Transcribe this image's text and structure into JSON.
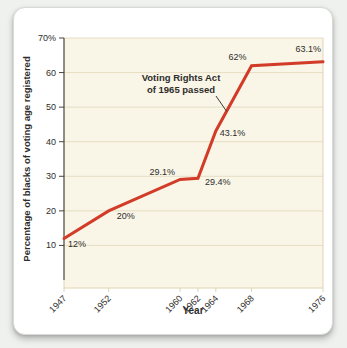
{
  "page": {
    "background_color": "#eff1ef",
    "card_background_color": "#ffffff"
  },
  "chart_data": {
    "type": "line",
    "title": "",
    "xlabel": "Year",
    "ylabel": "Percentage of blacks of voting age registered",
    "x": [
      1947,
      1952,
      1960,
      1962,
      1964,
      1968,
      1976
    ],
    "values": [
      12,
      20,
      29.1,
      29.4,
      43.1,
      62,
      63.1
    ],
    "x_tick_labels": [
      "1947",
      "1952",
      "1960",
      "1962",
      "1964",
      "1968",
      "1976"
    ],
    "y_ticks": [
      {
        "value": 70,
        "label": "70%"
      },
      {
        "value": 60,
        "label": "60"
      },
      {
        "value": 50,
        "label": "50"
      },
      {
        "value": 40,
        "label": "40"
      },
      {
        "value": 30,
        "label": "30"
      },
      {
        "value": 20,
        "label": "20"
      },
      {
        "value": 10,
        "label": "10"
      }
    ],
    "point_labels": [
      {
        "text": "12%",
        "anchor": "start",
        "dx": 4,
        "dy": 8
      },
      {
        "text": "20%",
        "anchor": "start",
        "dx": 8,
        "dy": 8
      },
      {
        "text": "29.1%",
        "anchor": "end",
        "dx": -5,
        "dy": -4
      },
      {
        "text": "29.4%",
        "anchor": "start",
        "dx": 7,
        "dy": 7
      },
      {
        "text": "43.1%",
        "anchor": "start",
        "dx": 4,
        "dy": 5
      },
      {
        "text": "62%",
        "anchor": "end",
        "dx": -5,
        "dy": -6
      },
      {
        "text": "63.1%",
        "anchor": "end",
        "dx": -2,
        "dy": -10
      }
    ],
    "xlim": [
      1947,
      1976
    ],
    "ylim": [
      0,
      70
    ],
    "grid": true,
    "annotation": {
      "line1": "Voting Rights Act",
      "line2": "of 1965 passed",
      "points_to": {
        "year": 1965.2,
        "value": 48.8
      }
    },
    "colors": {
      "line": "#d23b27",
      "grid": "#e7ddc3",
      "spine": "#e0d4b2",
      "plot_bg": "#f9f5e7",
      "axis": "#45443f",
      "text": "#2e2d2b"
    }
  }
}
